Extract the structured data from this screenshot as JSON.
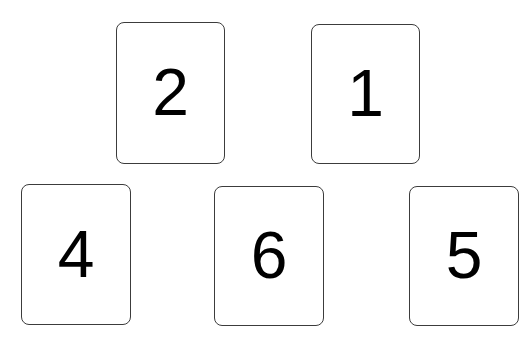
{
  "cards": [
    {
      "label": "2",
      "x": 116,
      "y": 22,
      "w": 109,
      "h": 142
    },
    {
      "label": "1",
      "x": 311,
      "y": 24,
      "w": 109,
      "h": 140
    },
    {
      "label": "4",
      "x": 21,
      "y": 184,
      "w": 110,
      "h": 141
    },
    {
      "label": "6",
      "x": 214,
      "y": 186,
      "w": 110,
      "h": 140
    },
    {
      "label": "5",
      "x": 409,
      "y": 186,
      "w": 110,
      "h": 140
    }
  ],
  "colors": {
    "background": "#ffffff",
    "card_border": "#3c3c3c",
    "digit": "#000000"
  }
}
